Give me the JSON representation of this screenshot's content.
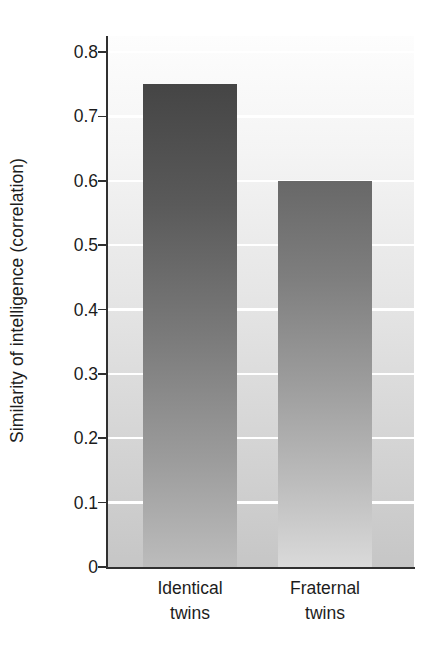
{
  "chart_data": {
    "type": "bar",
    "title": "",
    "xlabel": "",
    "ylabel": "Similarity of intelligence (correlation)",
    "categories": [
      "Identical twins",
      "Fraternal twins"
    ],
    "category_lines": [
      [
        "Identical",
        "twins"
      ],
      [
        "Fraternal",
        "twins"
      ]
    ],
    "values": [
      0.75,
      0.6
    ],
    "ylim": [
      0,
      0.825
    ],
    "yticks": [
      0,
      0.1,
      0.2,
      0.3,
      0.4,
      0.5,
      0.6,
      0.7,
      0.8
    ],
    "ytick_labels": [
      "0",
      "0.1",
      "0.2",
      "0.3",
      "0.4",
      "0.5",
      "0.6",
      "0.7",
      "0.8"
    ],
    "grid": "horizontal-white",
    "legend": "none",
    "bar_colors": [
      "#454545",
      "#686868"
    ],
    "plot_background": "#e6e6e6",
    "axis_color": "#303030",
    "text_color": "#1c1c1c"
  }
}
